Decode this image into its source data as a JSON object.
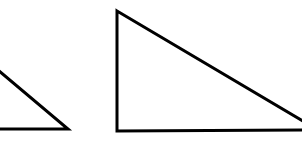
{
  "figure": {
    "background": "#ffffff",
    "stroke_color": "#000000",
    "stroke_width": 3,
    "shapes": [
      {
        "name": "left-triangle",
        "type": "right-triangle",
        "points": "-20,55 68,129 -20,129",
        "note": "partially cropped at left edge"
      },
      {
        "name": "right-triangle",
        "type": "right-triangle",
        "points": "117,11 330,140 117,131",
        "visible_points": "117,11 302,122 302,131 117,131",
        "note": "partially cropped at right edge"
      }
    ]
  }
}
